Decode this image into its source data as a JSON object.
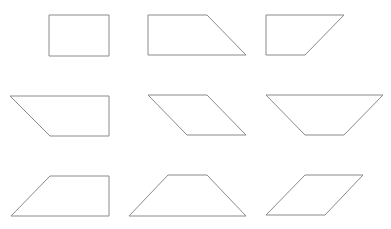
{
  "diagram": {
    "stroke_color": "#8a8a8a",
    "background": "#ffffff",
    "shapes": [
      {
        "id": "r1c1",
        "kind": "rectangle",
        "points": "49,15 109,15 109,56 49,56"
      },
      {
        "id": "r1c2",
        "kind": "right-trapezoid",
        "points": "148,15 207,15 246,55 148,55"
      },
      {
        "id": "r1c3",
        "kind": "right-trapezoid",
        "points": "266,15 344,15 305,55 266,55"
      },
      {
        "id": "r2c1",
        "kind": "right-trapezoid",
        "points": "10,96 109,96 109,136 50,136"
      },
      {
        "id": "r2c2",
        "kind": "parallelogram",
        "points": "148,95 207,95 246,135 187,135"
      },
      {
        "id": "r2c3",
        "kind": "isosceles-trapezoid",
        "points": "266,95 383,95 344,135 305,135"
      },
      {
        "id": "r3c1",
        "kind": "right-trapezoid",
        "points": "50,176 109,176 109,216 11,216"
      },
      {
        "id": "r3c2",
        "kind": "isosceles-trapezoid",
        "points": "168,175 207,175 246,216 129,216"
      },
      {
        "id": "r3c3",
        "kind": "parallelogram",
        "points": "305,175 363,175 325,215 266,215"
      }
    ]
  }
}
